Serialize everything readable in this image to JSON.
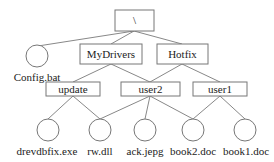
{
  "diagram": {
    "type": "directory-tree",
    "root": {
      "label": "\\"
    },
    "dirs": [
      {
        "label": "MyDrivers"
      },
      {
        "label": "Hotfix"
      },
      {
        "label": "update"
      },
      {
        "label": "user2"
      },
      {
        "label": "user1"
      }
    ],
    "files": [
      {
        "label": "Config.bat"
      },
      {
        "label": "drevdbfix.exe"
      },
      {
        "label": "rw.dll"
      },
      {
        "label": "ack.jepg"
      },
      {
        "label": "book2.doc"
      },
      {
        "label": "book1.doc"
      }
    ],
    "edges": [
      [
        "\\",
        "Config.bat"
      ],
      [
        "\\",
        "MyDrivers"
      ],
      [
        "\\",
        "Hotfix"
      ],
      [
        "MyDrivers",
        "update"
      ],
      [
        "MyDrivers",
        "user2"
      ],
      [
        "Hotfix",
        "user2"
      ],
      [
        "Hotfix",
        "user1"
      ],
      [
        "update",
        "drevdbfix.exe"
      ],
      [
        "update",
        "rw.dll"
      ],
      [
        "user2",
        "rw.dll"
      ],
      [
        "user2",
        "ack.jepg"
      ],
      [
        "user2",
        "book2.doc"
      ],
      [
        "user1",
        "book2.doc"
      ],
      [
        "user1",
        "book1.doc"
      ]
    ]
  }
}
